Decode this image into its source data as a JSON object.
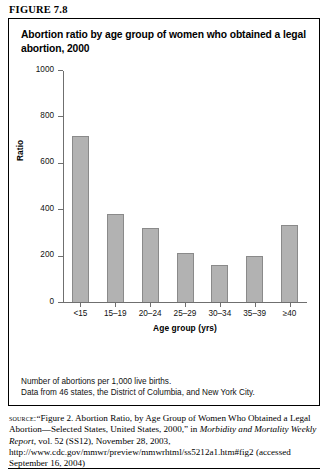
{
  "figure": {
    "label": "FIGURE 7.8",
    "title": "Abortion ratio by age group of women who obtained a legal abortion, 2000"
  },
  "notes": {
    "line1": "Number of abortions per 1,000 live births.",
    "line2": "Data from 46 states, the District of Columbia, and New York City."
  },
  "source": {
    "lead": "source:",
    "text_part1": "“Figure 2. Abortion Ratio, by Age Group of Women Who Obtained a Legal Abortion—Selected States, United States, 2000,” in ",
    "publication": "Morbidity and Mortality Weekly Report,",
    "text_part2": " vol. 52 (SS12), November 28, 2003, http://www.cdc.gov/mmwr/preview/mmwrhtml/ss5212a1.htm#fig2 (accessed September 16, 2004)"
  },
  "chart_data": {
    "type": "bar",
    "title": "Abortion ratio by age group of women who obtained a legal abortion, 2000",
    "xlabel": "Age group (yrs)",
    "ylabel": "Ratio",
    "categories": [
      "<15",
      "15–19",
      "20–24",
      "25–29",
      "30–34",
      "35–39",
      "≥40"
    ],
    "values": [
      715,
      380,
      318,
      212,
      158,
      200,
      332
    ],
    "ylim": [
      0,
      1000
    ],
    "yticks": [
      0,
      200,
      400,
      600,
      800,
      1000
    ],
    "ytick_labels": [
      "0",
      "200",
      "400",
      "600",
      "800",
      "1000"
    ],
    "grid": false,
    "legend": false,
    "bar_color": "#b2b2b2",
    "bar_border_color": "#8a8a8a",
    "axis_color": "#6f6f6f"
  }
}
